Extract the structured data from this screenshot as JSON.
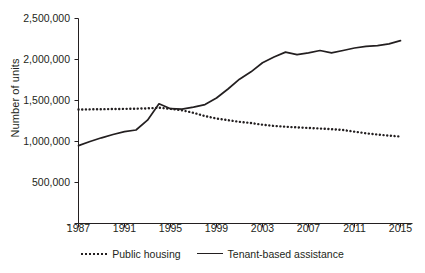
{
  "chart_data": {
    "type": "line",
    "title": "",
    "xlabel": "",
    "ylabel": "Number of units",
    "xlim": [
      1987,
      2015
    ],
    "ylim": [
      0,
      2500000
    ],
    "grid": false,
    "legend_position": "bottom",
    "x": [
      1987,
      1988,
      1989,
      1990,
      1991,
      1992,
      1993,
      1994,
      1995,
      1996,
      1997,
      1998,
      1999,
      2000,
      2001,
      2002,
      2003,
      2004,
      2005,
      2006,
      2007,
      2008,
      2009,
      2010,
      2011,
      2012,
      2013,
      2014,
      2015
    ],
    "y_ticks": [
      0,
      500000,
      1000000,
      1500000,
      2000000,
      2500000
    ],
    "y_tick_labels": [
      "-",
      "500,000",
      "1,000,000",
      "1,500,000",
      "2,000,000",
      "2,500,000"
    ],
    "x_ticks": [
      1987,
      1991,
      1995,
      1999,
      2003,
      2007,
      2011,
      2015
    ],
    "x_tick_labels": [
      "1987",
      "1991",
      "1995",
      "1999",
      "2003",
      "2007",
      "2011",
      "2015"
    ],
    "series": [
      {
        "name": "Public housing",
        "style": "dotted",
        "color": "#231f20",
        "values": [
          1390000,
          1392000,
          1394000,
          1396000,
          1398000,
          1400000,
          1404000,
          1412000,
          1398000,
          1380000,
          1350000,
          1310000,
          1280000,
          1260000,
          1240000,
          1225000,
          1205000,
          1190000,
          1180000,
          1172000,
          1165000,
          1158000,
          1150000,
          1140000,
          1120000,
          1100000,
          1085000,
          1072000,
          1060000
        ]
      },
      {
        "name": "Tenant-based assistance",
        "style": "solid",
        "color": "#231f20",
        "values": [
          950000,
          1000000,
          1045000,
          1085000,
          1120000,
          1140000,
          1260000,
          1460000,
          1400000,
          1395000,
          1420000,
          1450000,
          1530000,
          1640000,
          1760000,
          1850000,
          1960000,
          2030000,
          2090000,
          2060000,
          2080000,
          2110000,
          2080000,
          2110000,
          2140000,
          2160000,
          2170000,
          2190000,
          2230000
        ]
      }
    ]
  }
}
